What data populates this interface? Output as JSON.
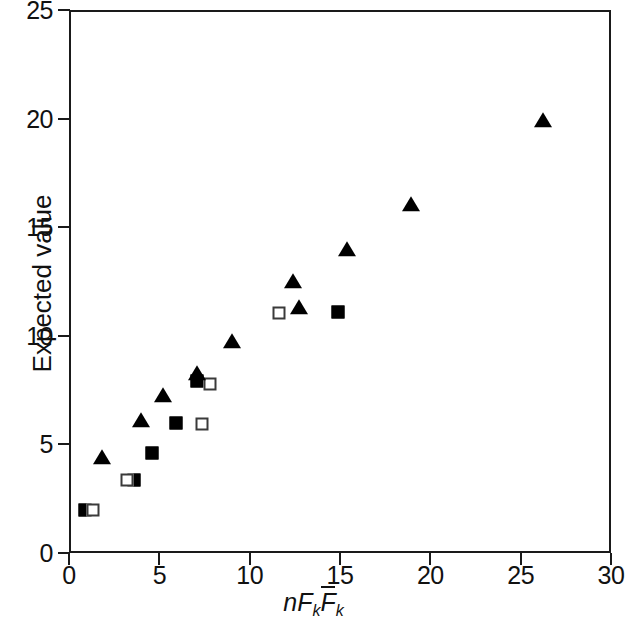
{
  "chart_data": {
    "type": "scatter",
    "title": "",
    "xlabel": "nFkFk",
    "xlabel_parts": {
      "n": "n",
      "f1": "F",
      "sub1": "k",
      "f2": "F",
      "sub2": "k"
    },
    "ylabel": "Expected value",
    "xlim": [
      0,
      30
    ],
    "ylim": [
      0,
      25
    ],
    "xticks": [
      "0",
      "5",
      "10",
      "15",
      "20",
      "25",
      "30"
    ],
    "xtick_values": [
      0,
      5,
      10,
      15,
      20,
      25,
      30
    ],
    "yticks": [
      "0",
      "5",
      "10",
      "15",
      "20",
      "25"
    ],
    "ytick_values": [
      0,
      5,
      10,
      15,
      20,
      25
    ],
    "grid": false,
    "legend": "none",
    "series": [
      {
        "name": "filled-square",
        "marker": "square-filled",
        "points": [
          {
            "x": 0.8,
            "y": 2.05
          },
          {
            "x": 3.5,
            "y": 3.45
          },
          {
            "x": 4.5,
            "y": 4.7
          },
          {
            "x": 5.8,
            "y": 6.1
          },
          {
            "x": 7.0,
            "y": 8.0
          },
          {
            "x": 14.8,
            "y": 11.2
          }
        ]
      },
      {
        "name": "open-square",
        "marker": "square-open",
        "points": [
          {
            "x": 1.2,
            "y": 2.05
          },
          {
            "x": 3.1,
            "y": 3.45
          },
          {
            "x": 7.25,
            "y": 6.05
          },
          {
            "x": 7.7,
            "y": 7.85
          },
          {
            "x": 11.5,
            "y": 11.15
          }
        ]
      },
      {
        "name": "filled-triangle",
        "marker": "triangle-filled",
        "points": [
          {
            "x": 1.7,
            "y": 4.45
          },
          {
            "x": 3.9,
            "y": 6.15
          },
          {
            "x": 5.1,
            "y": 7.3
          },
          {
            "x": 7.0,
            "y": 8.35
          },
          {
            "x": 8.9,
            "y": 9.8
          },
          {
            "x": 12.3,
            "y": 12.55
          },
          {
            "x": 12.6,
            "y": 11.35
          },
          {
            "x": 15.3,
            "y": 14.05
          },
          {
            "x": 18.8,
            "y": 16.1
          },
          {
            "x": 26.1,
            "y": 20.0
          }
        ]
      }
    ]
  }
}
